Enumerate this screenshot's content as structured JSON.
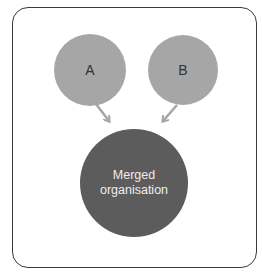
{
  "diagram": {
    "nodes": [
      {
        "id": "A",
        "label": "A",
        "color": "#a6a6a6"
      },
      {
        "id": "B",
        "label": "B",
        "color": "#a6a6a6"
      },
      {
        "id": "merged",
        "label_line1": "Merged",
        "label_line2": "organisation",
        "color": "#5c5c5c"
      }
    ],
    "edges": [
      {
        "from": "A",
        "to": "merged"
      },
      {
        "from": "B",
        "to": "merged"
      }
    ],
    "colors": {
      "frame": "#3a3a3a",
      "arrow": "#a6a6a6"
    }
  }
}
